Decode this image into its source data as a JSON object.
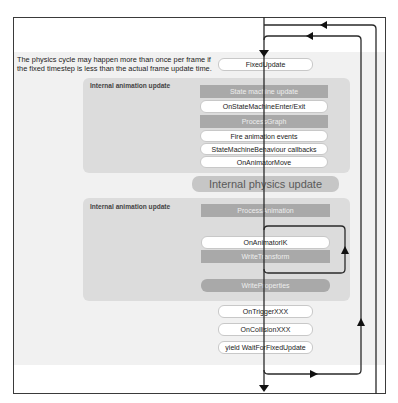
{
  "note": {
    "line1": "The physics cycle may happen more than once per frame if",
    "line2": "the fixed timestep is less than the actual frame update time."
  },
  "fixed_update": "FixedUpdate",
  "animation_panel_1": {
    "title": "Internal animation update",
    "steps": [
      {
        "label": "State machine update",
        "style": "internal"
      },
      {
        "label": "OnStateMachineEnter/Exit",
        "style": "callback"
      },
      {
        "label": "ProcessGraph",
        "style": "internal"
      },
      {
        "label": "Fire animation events",
        "style": "callback"
      },
      {
        "label": "StateMachineBehaviour callbacks",
        "style": "callback"
      },
      {
        "label": "OnAnimatorMove",
        "style": "callback"
      }
    ]
  },
  "physics_update": "Internal physics update",
  "animation_panel_2": {
    "title": "Internal animation update",
    "steps": [
      {
        "label": "ProcessAnimation",
        "style": "internal"
      },
      {
        "label": "OnAnimatorIK",
        "style": "callback"
      },
      {
        "label": "WriteTransform",
        "style": "internal"
      },
      {
        "label": "WriteProperties",
        "style": "internal"
      }
    ]
  },
  "post_physics": [
    {
      "label": "OnTriggerXXX"
    },
    {
      "label": "OnCollisionXXX"
    },
    {
      "label": "yield WaitForFixedUpdate"
    }
  ],
  "colors": {
    "line": "#2a2a2a",
    "band": "#f1f1f1",
    "panel": "#dcdcdc",
    "internal_box": "#a9a9a9",
    "callback_box": "#ffffff",
    "physics_box": "#c6c6c6"
  }
}
